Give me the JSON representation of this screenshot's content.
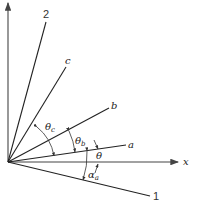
{
  "diagram": {
    "type": "angle-diagram",
    "origin": [
      8,
      162
    ],
    "axes": {
      "x_label": "x",
      "y_label": ""
    },
    "lines": [
      {
        "id": "2",
        "label": "2",
        "end": [
          46,
          22
        ],
        "label_pos": [
          46,
          18
        ]
      },
      {
        "id": "c",
        "label": "c",
        "end": [
          67,
          65
        ],
        "label_pos": [
          68,
          63
        ]
      },
      {
        "id": "b",
        "label": "b",
        "end": [
          110,
          108
        ],
        "label_pos": [
          113,
          110
        ]
      },
      {
        "id": "a",
        "label": "a",
        "end": [
          128,
          145
        ],
        "label_pos": [
          131,
          149
        ]
      },
      {
        "id": "1",
        "label": "1",
        "end": [
          152,
          196
        ],
        "label_pos": [
          155,
          200
        ]
      }
    ],
    "angles": [
      {
        "id": "theta_c",
        "label": "θ",
        "subscript": "c",
        "label_pos": [
          49,
          132
        ]
      },
      {
        "id": "theta_b",
        "label": "θ",
        "subscript": "b",
        "label_pos": [
          79,
          140
        ]
      },
      {
        "id": "theta",
        "label": "θ",
        "subscript": "",
        "label_pos": [
          108,
          156
        ]
      },
      {
        "id": "alpha_a",
        "label": "α",
        "subscript": "a",
        "label_pos": [
          89,
          180
        ]
      }
    ],
    "colors": {
      "line": "#222222",
      "axis": "#444444",
      "background": "#ffffff"
    }
  }
}
